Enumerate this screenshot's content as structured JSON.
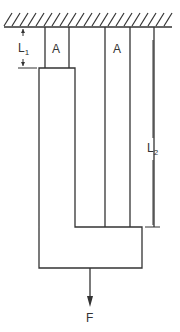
{
  "diagram": {
    "type": "mechanics-free-body",
    "labels": {
      "l1": "L",
      "l1_sub": "1",
      "l2": "L",
      "l2_sub": "2",
      "area_left": "A",
      "area_right": "A",
      "force": "F"
    },
    "colors": {
      "line": "#333333",
      "background": "#ffffff"
    }
  }
}
